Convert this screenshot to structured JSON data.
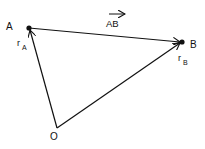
{
  "diagram": {
    "colors": {
      "stroke": "#111111",
      "background": "#ffffff"
    },
    "points": [
      {
        "id": "A",
        "label": "A",
        "x": 29,
        "y": 28
      },
      {
        "id": "B",
        "label": "B",
        "x": 182,
        "y": 42
      },
      {
        "id": "O",
        "label": "O",
        "x": 57,
        "y": 128
      }
    ],
    "vectors": [
      {
        "id": "rA",
        "from": "O",
        "to": "A",
        "label_main": "r",
        "label_sub": "A"
      },
      {
        "id": "rB",
        "from": "O",
        "to": "B",
        "label_main": "r",
        "label_sub": "B"
      },
      {
        "id": "AB",
        "from": "A",
        "to": "B",
        "label": "AB",
        "overline_arrow": true
      }
    ],
    "labels": {
      "A": "A",
      "B": "B",
      "O": "O",
      "rA_main": "r",
      "rA_sub": "A",
      "rB_main": "r",
      "rB_sub": "B",
      "AB": "AB"
    }
  }
}
